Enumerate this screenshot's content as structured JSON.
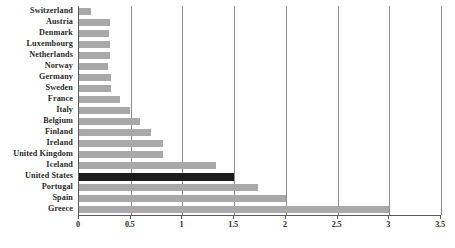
{
  "chart_data": {
    "type": "bar",
    "orientation": "horizontal",
    "title": "",
    "subtitle": "",
    "xlabel": "",
    "ylabel": "",
    "xlim": [
      0,
      3.5
    ],
    "xticks": [
      0,
      0.5,
      1,
      1.5,
      2,
      2.5,
      3,
      3.5
    ],
    "xtick_labels": [
      "0",
      "0.5",
      "1",
      "1.5",
      "2",
      "2.5",
      "3",
      "3.5"
    ],
    "grid": true,
    "grid_axis": "x",
    "legend": null,
    "annotations": [],
    "highlight_category": "United States",
    "colors": {
      "bar": "#a9a9a9",
      "highlight_bar": "#1c1c1c",
      "axis": "#5a5a5a",
      "gridline": "#8e8e8e",
      "text": "#2b2b2b",
      "background": "#ffffff"
    },
    "categories": [
      "Switzerland",
      "Austria",
      "Denmark",
      "Luxembourg",
      "Netherlands",
      "Norway",
      "Germany",
      "Sweden",
      "France",
      "Italy",
      "Belgium",
      "Finland",
      "Ireland",
      "United Kingdom",
      "Iceland",
      "United States",
      "Portugal",
      "Spain",
      "Greece"
    ],
    "values": [
      0.12,
      0.3,
      0.29,
      0.3,
      0.3,
      0.28,
      0.31,
      0.31,
      0.4,
      0.49,
      0.59,
      0.7,
      0.81,
      0.81,
      1.32,
      1.5,
      1.73,
      2.0,
      3.0
    ],
    "bars": [
      {
        "label": "Switzerland",
        "value": 0.12,
        "highlighted": false
      },
      {
        "label": "Austria",
        "value": 0.3,
        "highlighted": false
      },
      {
        "label": "Denmark",
        "value": 0.29,
        "highlighted": false
      },
      {
        "label": "Luxembourg",
        "value": 0.3,
        "highlighted": false
      },
      {
        "label": "Netherlands",
        "value": 0.3,
        "highlighted": false
      },
      {
        "label": "Norway",
        "value": 0.28,
        "highlighted": false
      },
      {
        "label": "Germany",
        "value": 0.31,
        "highlighted": false
      },
      {
        "label": "Sweden",
        "value": 0.31,
        "highlighted": false
      },
      {
        "label": "France",
        "value": 0.4,
        "highlighted": false
      },
      {
        "label": "Italy",
        "value": 0.49,
        "highlighted": false
      },
      {
        "label": "Belgium",
        "value": 0.59,
        "highlighted": false
      },
      {
        "label": "Finland",
        "value": 0.7,
        "highlighted": false
      },
      {
        "label": "Ireland",
        "value": 0.81,
        "highlighted": false
      },
      {
        "label": "United Kingdom",
        "value": 0.81,
        "highlighted": false
      },
      {
        "label": "Iceland",
        "value": 1.32,
        "highlighted": false
      },
      {
        "label": "United States",
        "value": 1.5,
        "highlighted": true
      },
      {
        "label": "Portugal",
        "value": 1.73,
        "highlighted": false
      },
      {
        "label": "Spain",
        "value": 2.0,
        "highlighted": false
      },
      {
        "label": "Greece",
        "value": 3.0,
        "highlighted": false
      }
    ]
  }
}
